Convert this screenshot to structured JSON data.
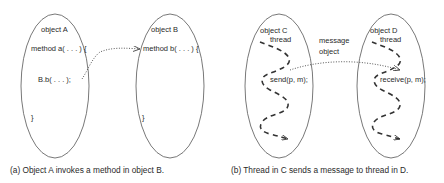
{
  "panel_a": {
    "object_a": {
      "title": "object A",
      "method_decl": "method a( . . . ) {",
      "call": "B.b( . . . );",
      "close": "}"
    },
    "object_b": {
      "title": "object B",
      "method_decl": "method b( . . . ) {",
      "close": "}"
    },
    "caption": "(a) Object A invokes a method in object B."
  },
  "panel_b": {
    "object_c": {
      "title": "object C",
      "thread_label": "thread",
      "call": "send(p, m);"
    },
    "object_d": {
      "title": "object D",
      "thread_label": "thread",
      "call": "receive(p, m);"
    },
    "message_label_line1": "message",
    "message_label_line2": "object",
    "caption": "(b) Thread in C sends a message to thread in D."
  },
  "colors": {
    "stroke": "#555555",
    "text": "#2a2a2a",
    "background": "#ffffff"
  }
}
